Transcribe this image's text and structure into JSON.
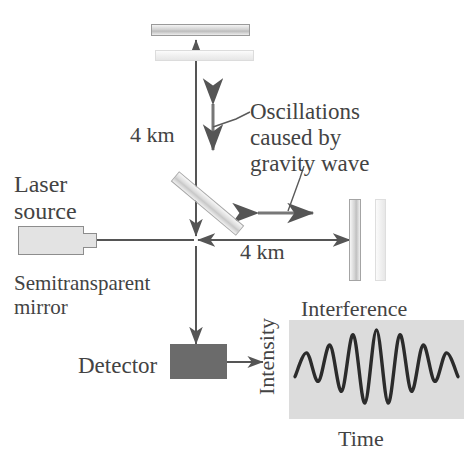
{
  "diagram": {
    "title_absent": true,
    "labels": {
      "laser_source": "Laser\nsource",
      "semitransparent_mirror": "Semitransparent\nmirror",
      "oscillations": "Oscillations\ncaused by\ngravity wave",
      "arm_length_vertical": "4 km",
      "arm_length_horizontal": "4 km",
      "detector": "Detector",
      "interference": "Interference",
      "axis_x": "Time",
      "axis_y": "Intensity"
    },
    "colors": {
      "ink": "#434343",
      "beam_line": "#555555",
      "mirror_light": "#ededed",
      "mirror_mid": "#d2d2d2",
      "detector_fill": "#6b6b6b",
      "laser_fill": "#e3e3e3",
      "plot_background": "#dcdcdc",
      "wave_stroke": "#2b2b2b"
    },
    "components": [
      {
        "name": "laser-source",
        "kind": "box-with-nozzle"
      },
      {
        "name": "semitransparent-mirror",
        "kind": "diagonal-plate"
      },
      {
        "name": "top-mirror-near",
        "kind": "horizontal-plate"
      },
      {
        "name": "top-mirror-far",
        "kind": "horizontal-plate"
      },
      {
        "name": "right-mirror-near",
        "kind": "vertical-plate"
      },
      {
        "name": "right-mirror-far",
        "kind": "vertical-plate"
      },
      {
        "name": "detector",
        "kind": "filled-box"
      },
      {
        "name": "interference-plot",
        "kind": "waveform-panel"
      }
    ]
  },
  "chart_data": {
    "type": "line",
    "title": "Interference",
    "xlabel": "Time",
    "ylabel": "Intensity",
    "grid": false,
    "legend": null,
    "peak_count": 7,
    "peak_relative_amplitudes": [
      0.42,
      0.62,
      0.88,
      1.0,
      0.88,
      0.62,
      0.42
    ],
    "x": [
      0,
      1,
      2,
      3,
      4,
      5,
      6,
      7,
      8,
      9,
      10,
      11,
      12,
      13,
      14
    ],
    "y": [
      -0.18,
      0.42,
      -0.3,
      0.62,
      -0.55,
      0.88,
      -0.85,
      1.0,
      -0.85,
      0.88,
      -0.55,
      0.62,
      -0.3,
      0.42,
      -0.18
    ],
    "xlim": [
      0,
      14
    ],
    "ylim": [
      -1.05,
      1.05
    ]
  }
}
